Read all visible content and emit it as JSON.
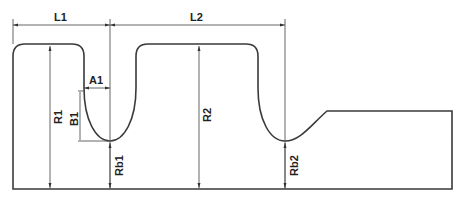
{
  "diagram": {
    "type": "technical-profile-drawing",
    "colors": {
      "stroke": "#3a3a3a",
      "dimension": "#555555",
      "background": "#ffffff"
    },
    "labels": {
      "L1": "L1",
      "L2": "L2",
      "A1": "A1",
      "B1": "B1",
      "R1": "R1",
      "R2": "R2",
      "Rb1": "Rb1",
      "Rb2": "Rb2"
    },
    "dimensions": [
      {
        "id": "L1",
        "kind": "horizontal-length",
        "from": "left edge",
        "to": "groove 1 center"
      },
      {
        "id": "L2",
        "kind": "horizontal-length",
        "from": "groove 1 center",
        "to": "groove 2 center"
      },
      {
        "id": "A1",
        "kind": "horizontal",
        "meaning": "groove 1 half-width"
      },
      {
        "id": "B1",
        "kind": "vertical",
        "meaning": "groove 1 depth"
      },
      {
        "id": "R1",
        "kind": "vertical-radius",
        "meaning": "land 1 radius"
      },
      {
        "id": "R2",
        "kind": "vertical-radius",
        "meaning": "land 2 radius"
      },
      {
        "id": "Rb1",
        "kind": "vertical-radius",
        "meaning": "groove 1 bottom radius"
      },
      {
        "id": "Rb2",
        "kind": "vertical-radius",
        "meaning": "groove 2 bottom radius"
      }
    ]
  }
}
